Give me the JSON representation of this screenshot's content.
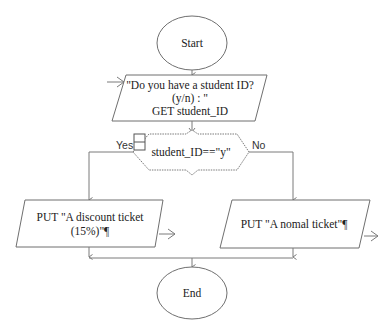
{
  "diagram": {
    "type": "flowchart",
    "nodes": {
      "start": {
        "label": "Start",
        "shape": "ellipse"
      },
      "input": {
        "shape": "parallelogram",
        "lines": [
          "\"Do you have a student ID?",
          "(y/n) : \"",
          "GET student_ID"
        ]
      },
      "decision": {
        "shape": "hexagon",
        "label": "student_ID==\"y\""
      },
      "yes_output": {
        "shape": "parallelogram",
        "lines": [
          "PUT \"A discount ticket",
          "(15%)\"¶"
        ]
      },
      "no_output": {
        "shape": "parallelogram",
        "lines": [
          "PUT \"A nomal ticket\"¶"
        ]
      },
      "end": {
        "label": "End",
        "shape": "ellipse"
      }
    },
    "edge_labels": {
      "yes": "Yes",
      "no": "No"
    },
    "colors": {
      "stroke": "#6f6f6f",
      "text": "#222222",
      "background": "#ffffff"
    }
  }
}
